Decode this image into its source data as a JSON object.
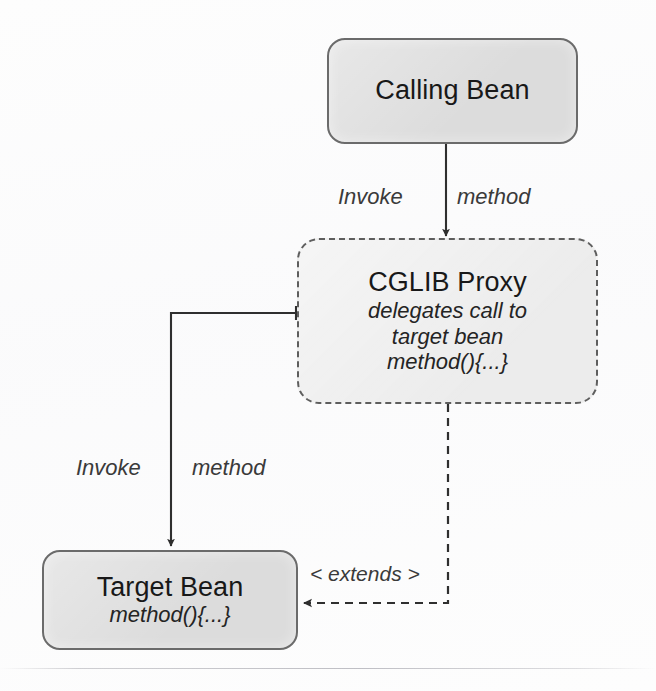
{
  "diagram": {
    "background_color": "#fdfdfd",
    "stroke_color": "#333333",
    "node_fill_color": "#dcdcdc",
    "node_border_color": "#6b6b6b",
    "nodes": [
      {
        "id": "calling-bean",
        "title": "Calling Bean",
        "subtitle_lines": [],
        "border_style": "solid"
      },
      {
        "id": "cglib-proxy",
        "title": "CGLIB Proxy",
        "subtitle_lines": [
          "delegates call to",
          "target bean",
          "method(){...}"
        ],
        "border_style": "dashed"
      },
      {
        "id": "target-bean",
        "title": "Target Bean",
        "subtitle_lines": [
          "method(){...}"
        ],
        "border_style": "solid"
      }
    ],
    "edges": [
      {
        "id": "calling-to-proxy",
        "from": "calling-bean",
        "to": "cglib-proxy",
        "style": "solid",
        "arrow": "end",
        "label_left": "Invoke",
        "label_right": "method"
      },
      {
        "id": "proxy-to-target",
        "from": "cglib-proxy",
        "to": "target-bean",
        "style": "solid",
        "arrow": "end",
        "label_left": "Invoke",
        "label_right": "method"
      },
      {
        "id": "proxy-extends-target",
        "from": "cglib-proxy",
        "to": "target-bean",
        "style": "dashed",
        "arrow": "end",
        "label": "< extends >"
      }
    ]
  }
}
